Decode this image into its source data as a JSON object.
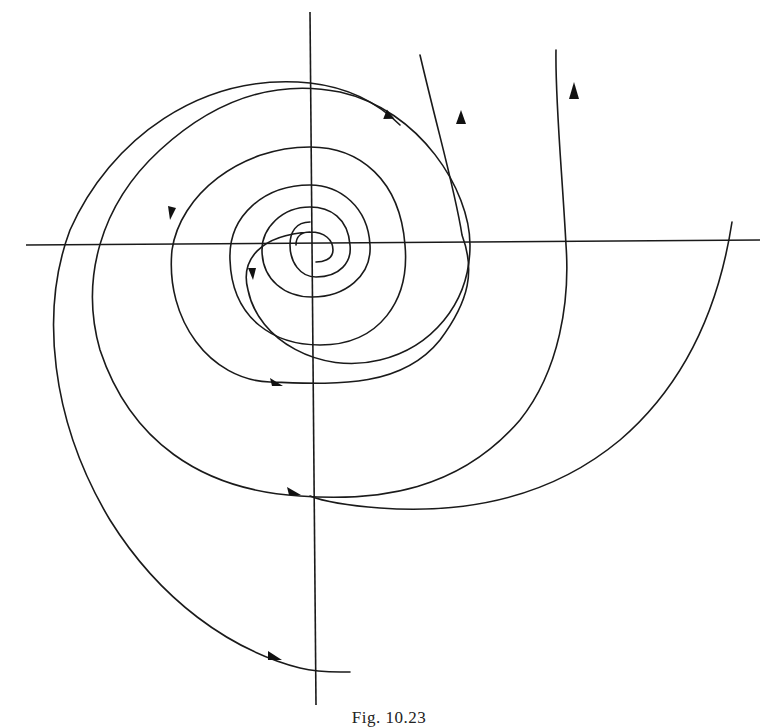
{
  "figure": {
    "caption": "Fig. 10.23",
    "colors": {
      "ink": "#1a1a1a",
      "background": "#ffffff"
    },
    "axes": {
      "horizontal": {
        "x1": 26,
        "y1": 245,
        "x2": 760,
        "y2": 240
      },
      "vertical": {
        "x1": 310,
        "y1": 12,
        "x2": 316,
        "y2": 705
      }
    },
    "origin": {
      "x": 310,
      "y": 245
    },
    "trajectories": [
      {
        "id": "spiral-a",
        "end": "bottom",
        "arrows": 4
      },
      {
        "id": "spiral-b",
        "end": "top-right",
        "arrows": 3
      },
      {
        "id": "arc-c",
        "end": "top-right",
        "arrows": 1
      },
      {
        "id": "arc-d",
        "end": "right",
        "arrows": 0
      }
    ]
  }
}
